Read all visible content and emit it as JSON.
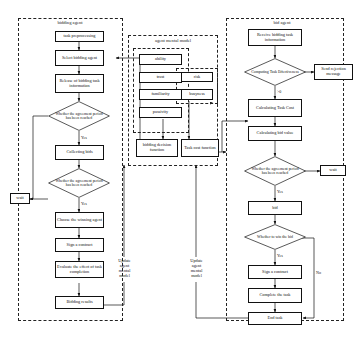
{
  "diagram": {
    "panels": {
      "bidding_agent": "bidding agent",
      "agent_mental_model": "agent mental model",
      "bid_agent": "bid agent"
    },
    "left_flow": {
      "task_preprocessing": "task preprocessing",
      "select_bidding_agent": "Select bidding agent",
      "release_info": "Release of bidding task information",
      "decision_period_1": "Whether the agreement period has been reached",
      "collecting_bids": "Collecting bids",
      "decision_period_2": "Whether the agreement period has been reached",
      "choose_winning_agent": "Choose the winning agent",
      "sign_contract": "Sign a contract",
      "evaluate_effect": "Evaluate the effect of task completion",
      "bidding_results": "Bidding results",
      "wait": "wait",
      "yes_1": "Yes",
      "yes_2": "Yes"
    },
    "mental_model": {
      "attributes": [
        "ability",
        "trust",
        "familiarity",
        "passivity"
      ],
      "cost_attributes": [
        "risk",
        "busyness"
      ],
      "bidding_decision_function": "bidding decision function",
      "task_cost_function": "Task cost function",
      "update_left": "Update agent mental model",
      "update_right": "Update agent mental model"
    },
    "right_flow": {
      "receive_info": "Receive bidding task information",
      "computing_effectiveness": "Computing Task Effectiveness",
      "send_rejection": "Send rejection message",
      "gt_zero": ">0",
      "calculating_task_cost": "Calculating Task Cost",
      "calculating_bid_value": "Calculating bid value",
      "decision_period": "Whether the agreement period has been reached",
      "wait": "wait",
      "yes_period": "Yes",
      "bid": "bid",
      "decision_win": "Whether to win the bid",
      "yes_win": "Yes",
      "no_win": "No",
      "sign_contract": "Sign a contract",
      "complete_task": "Complete the task",
      "end_task": "End task"
    }
  }
}
